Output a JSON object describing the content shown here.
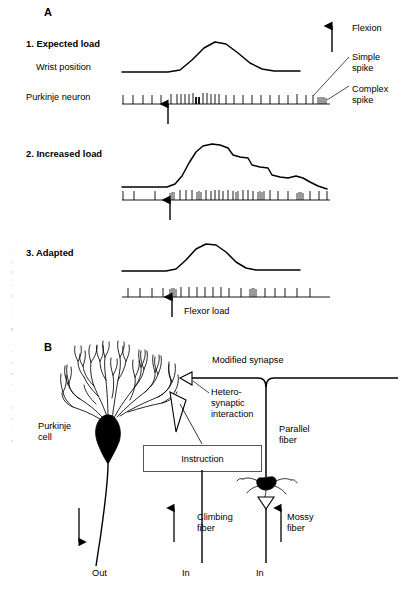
{
  "figure": {
    "type": "scientific-diagram"
  },
  "panel_a": {
    "letter": "A",
    "conditions": [
      {
        "index": 1,
        "label": "1. Expected load"
      },
      {
        "index": 2,
        "label": "2. Increased load"
      },
      {
        "index": 3,
        "label": "3. Adapted"
      }
    ],
    "row_labels": {
      "wrist": "Wrist position",
      "purkinje": "Purkinje neuron"
    },
    "annotations": {
      "flexion": "Flexion",
      "simple_spike": "Simple\nspike",
      "complex_spike": "Complex\nspike",
      "flexor_load": "Flexor load"
    }
  },
  "panel_b": {
    "letter": "B",
    "labels": {
      "purkinje_cell": "Purkinje\ncell",
      "modified_synapse": "Modified synapse",
      "heterosynaptic": "Hetero-\nsynaptic\ninteraction",
      "parallel_fiber": "Parallel\nfiber",
      "instruction": "Instruction",
      "climbing_fiber": "Climbing\nfiber",
      "mossy_fiber": "Mossy\nfiber",
      "out": "Out",
      "in_climbing": "In",
      "in_mossy": "In"
    }
  },
  "chart_data": {
    "type": "line",
    "xlabel": "",
    "ylabel": "",
    "grid": false,
    "legend": "none",
    "traces": [
      {
        "name": "1. Expected load",
        "description": "Smooth single-peak wrist flexion; simple-spike train with a burst near movement onset and a complex spike at the end.",
        "wrist_points": "122,72 168,72 180,70 192,60 204,48 215,42 226,44 238,53 250,63 262,69 274,71 300,71",
        "spikes": [
          {
            "x": 123,
            "h": 9,
            "w": 0.9
          },
          {
            "x": 133,
            "h": 9,
            "w": 0.9
          },
          {
            "x": 143,
            "h": 9,
            "w": 0.9
          },
          {
            "x": 152,
            "h": 9,
            "w": 0.9
          },
          {
            "x": 161,
            "h": 9,
            "w": 0.9
          },
          {
            "x": 171,
            "h": 10,
            "w": 0.9
          },
          {
            "x": 177,
            "h": 10,
            "w": 0.9
          },
          {
            "x": 181,
            "h": 10,
            "w": 0.9
          },
          {
            "x": 185,
            "h": 10,
            "w": 0.9
          },
          {
            "x": 189,
            "h": 10,
            "w": 0.9
          },
          {
            "x": 193,
            "h": 11,
            "w": 0.9
          },
          {
            "x": 196,
            "h": 7,
            "w": 1.8
          },
          {
            "x": 199,
            "h": 7,
            "w": 1.8
          },
          {
            "x": 203,
            "h": 11,
            "w": 0.9
          },
          {
            "x": 207,
            "h": 11,
            "w": 0.9
          },
          {
            "x": 211,
            "h": 10,
            "w": 0.9
          },
          {
            "x": 215,
            "h": 10,
            "w": 0.9
          },
          {
            "x": 219,
            "h": 10,
            "w": 0.9
          },
          {
            "x": 226,
            "h": 9,
            "w": 0.9
          },
          {
            "x": 234,
            "h": 9,
            "w": 0.9
          },
          {
            "x": 243,
            "h": 9,
            "w": 0.9
          },
          {
            "x": 252,
            "h": 9,
            "w": 0.9
          },
          {
            "x": 261,
            "h": 9,
            "w": 0.9
          },
          {
            "x": 270,
            "h": 9,
            "w": 0.9
          },
          {
            "x": 279,
            "h": 9,
            "w": 0.9
          },
          {
            "x": 288,
            "h": 9,
            "w": 0.9
          },
          {
            "x": 297,
            "h": 10,
            "w": 0.9
          },
          {
            "x": 306,
            "h": 9,
            "w": 0.9
          },
          {
            "x": 313,
            "h": 9,
            "w": 0.9
          },
          {
            "x": 318,
            "h": 7,
            "w": 0.8
          },
          {
            "x": 320,
            "h": 7,
            "w": 0.8
          },
          {
            "x": 322,
            "h": 7,
            "w": 0.8
          },
          {
            "x": 324,
            "h": 7,
            "w": 0.8
          },
          {
            "x": 326,
            "h": 6,
            "w": 0.8
          }
        ],
        "arrow_x": 168
      },
      {
        "name": "2. Increased load",
        "description": "Larger, prolonged and oscillatory wrist excursion that fails to return to baseline; denser simple-spike bursting.",
        "wrist_points": "122,187 167,187 175,184 182,176 189,163 196,152 203,146 212,144 220,145 228,148 233,155 240,157 248,158 252,165 260,167 268,168 272,175 280,177 288,178 296,176 303,178 310,182 318,186 327,189",
        "spikes": [
          {
            "x": 123,
            "h": 9,
            "w": 0.9
          },
          {
            "x": 134,
            "h": 9,
            "w": 0.9
          },
          {
            "x": 155,
            "h": 9,
            "w": 0.9
          },
          {
            "x": 170,
            "h": 7,
            "w": 0.8
          },
          {
            "x": 172,
            "h": 8,
            "w": 0.8
          },
          {
            "x": 174,
            "h": 8,
            "w": 0.8
          },
          {
            "x": 180,
            "h": 10,
            "w": 0.9
          },
          {
            "x": 186,
            "h": 10,
            "w": 0.9
          },
          {
            "x": 192,
            "h": 10,
            "w": 0.9
          },
          {
            "x": 197,
            "h": 8,
            "w": 0.8
          },
          {
            "x": 199,
            "h": 9,
            "w": 0.8
          },
          {
            "x": 201,
            "h": 8,
            "w": 0.8
          },
          {
            "x": 206,
            "h": 10,
            "w": 0.9
          },
          {
            "x": 211,
            "h": 9,
            "w": 0.9
          },
          {
            "x": 215,
            "h": 10,
            "w": 0.9
          },
          {
            "x": 219,
            "h": 10,
            "w": 0.9
          },
          {
            "x": 223,
            "h": 9,
            "w": 0.9
          },
          {
            "x": 228,
            "h": 10,
            "w": 0.9
          },
          {
            "x": 233,
            "h": 9,
            "w": 0.9
          },
          {
            "x": 236,
            "h": 8,
            "w": 0.8
          },
          {
            "x": 238,
            "h": 9,
            "w": 0.8
          },
          {
            "x": 243,
            "h": 10,
            "w": 0.9
          },
          {
            "x": 248,
            "h": 10,
            "w": 0.9
          },
          {
            "x": 253,
            "h": 9,
            "w": 0.9
          },
          {
            "x": 258,
            "h": 8,
            "w": 0.8
          },
          {
            "x": 260,
            "h": 9,
            "w": 0.8
          },
          {
            "x": 262,
            "h": 8,
            "w": 0.8
          },
          {
            "x": 264,
            "h": 9,
            "w": 0.8
          },
          {
            "x": 270,
            "h": 10,
            "w": 0.9
          },
          {
            "x": 278,
            "h": 9,
            "w": 0.9
          },
          {
            "x": 288,
            "h": 9,
            "w": 0.9
          },
          {
            "x": 297,
            "h": 7,
            "w": 0.8
          },
          {
            "x": 299,
            "h": 8,
            "w": 0.8
          },
          {
            "x": 301,
            "h": 8,
            "w": 0.8
          },
          {
            "x": 303,
            "h": 7,
            "w": 0.8
          },
          {
            "x": 310,
            "h": 9,
            "w": 0.9
          },
          {
            "x": 319,
            "h": 9,
            "w": 0.9
          },
          {
            "x": 327,
            "h": 9,
            "w": 0.9
          }
        ],
        "arrow_x": 170
      },
      {
        "name": "3. Adapted",
        "description": "Movement restored to a smooth single peak like the expected-load condition; simple-spike pattern normalized.",
        "wrist_points": "122,271 166,271 176,269 186,260 196,249 206,244 216,245 226,252 236,262 246,268 256,270 300,270",
        "spikes": [
          {
            "x": 128,
            "h": 9,
            "w": 0.9
          },
          {
            "x": 140,
            "h": 9,
            "w": 0.9
          },
          {
            "x": 152,
            "h": 9,
            "w": 0.9
          },
          {
            "x": 163,
            "h": 9,
            "w": 0.9
          },
          {
            "x": 170,
            "h": 8,
            "w": 0.8
          },
          {
            "x": 172,
            "h": 9,
            "w": 0.8
          },
          {
            "x": 174,
            "h": 9,
            "w": 0.8
          },
          {
            "x": 176,
            "h": 8,
            "w": 0.8
          },
          {
            "x": 181,
            "h": 10,
            "w": 0.9
          },
          {
            "x": 189,
            "h": 10,
            "w": 0.9
          },
          {
            "x": 197,
            "h": 10,
            "w": 0.9
          },
          {
            "x": 205,
            "h": 10,
            "w": 0.9
          },
          {
            "x": 213,
            "h": 10,
            "w": 0.9
          },
          {
            "x": 221,
            "h": 10,
            "w": 0.9
          },
          {
            "x": 229,
            "h": 9,
            "w": 0.9
          },
          {
            "x": 241,
            "h": 9,
            "w": 0.9
          },
          {
            "x": 250,
            "h": 8,
            "w": 0.8
          },
          {
            "x": 252,
            "h": 9,
            "w": 0.8
          },
          {
            "x": 254,
            "h": 9,
            "w": 0.8
          },
          {
            "x": 256,
            "h": 8,
            "w": 0.8
          },
          {
            "x": 265,
            "h": 9,
            "w": 0.9
          },
          {
            "x": 275,
            "h": 9,
            "w": 0.9
          },
          {
            "x": 285,
            "h": 9,
            "w": 0.9
          },
          {
            "x": 297,
            "h": 9,
            "w": 0.9
          },
          {
            "x": 310,
            "h": 9,
            "w": 0.9
          }
        ],
        "arrow_x": 172
      }
    ]
  }
}
